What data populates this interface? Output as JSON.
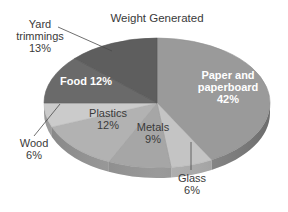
{
  "chart_data": {
    "type": "pie",
    "style": "3d-tilted",
    "title": "Weight Generated",
    "start": "top",
    "direction": "clockwise",
    "slices": [
      {
        "label": "Paper and paperboard",
        "lines": [
          "Paper and",
          "paperboard",
          "42%"
        ],
        "value": 42,
        "color": "#9a9a9a",
        "label_position": "inside",
        "label_style": "light-bold"
      },
      {
        "label": "Glass",
        "lines": [
          "Glass",
          "6%"
        ],
        "value": 6,
        "color": "#c4c4c4",
        "label_position": "outside-bottom",
        "label_style": "dark"
      },
      {
        "label": "Metals",
        "lines": [
          "Metals",
          "9%"
        ],
        "value": 9,
        "color": "#a6a6a6",
        "label_position": "inside",
        "label_style": "dark"
      },
      {
        "label": "Plastics",
        "lines": [
          "Plastics",
          "12%"
        ],
        "value": 12,
        "color": "#b2b2b2",
        "label_position": "inside",
        "label_style": "dark"
      },
      {
        "label": "Wood",
        "lines": [
          "Wood",
          "6%"
        ],
        "value": 6,
        "color": "#cbcbcb",
        "label_position": "outside-left",
        "label_style": "dark"
      },
      {
        "label": "Food",
        "lines": [
          "Food 12%"
        ],
        "value": 12,
        "color": "#6a6a6a",
        "label_position": "inside",
        "label_style": "light-bold"
      },
      {
        "label": "Yard trimmings",
        "lines": [
          "Yard",
          "trimmings",
          "13%"
        ],
        "value": 13,
        "color": "#5e5e5e",
        "label_position": "outside-top-left",
        "label_style": "dark"
      }
    ]
  }
}
